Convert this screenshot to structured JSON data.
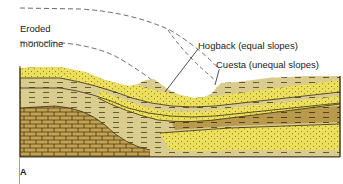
{
  "labels": {
    "eroded_line1": "Eroded",
    "eroded_line2": "monocline",
    "hogback": "Hogback (equal slopes)",
    "cuesta": "Cuesta (unequal slopes)",
    "panel": "A"
  },
  "colors": {
    "sandstone": "#e9dc5a",
    "shale_light": "#d8cb8c",
    "shale_dark": "#b89a4a",
    "limestone": "#c2a24e",
    "outline": "#3a2e12",
    "dash": "#444444",
    "background": "#ffffff"
  }
}
